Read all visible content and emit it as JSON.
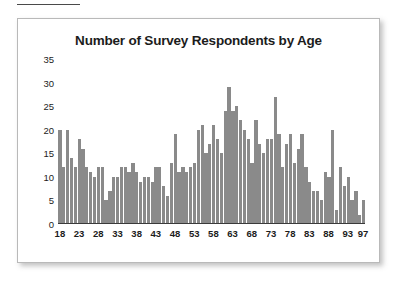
{
  "page": {
    "background_color": "#ffffff",
    "card_background": "#ffffff",
    "card_border_color": "#b9b9b9",
    "bar_color": "#8a8a8a",
    "axis_color": "#3a3a3a",
    "text_color": "#1c1c1c"
  },
  "chart_data": {
    "type": "bar",
    "title": "Number of Survey Respondents by Age",
    "xlabel": "",
    "ylabel": "",
    "ylim": [
      0,
      35
    ],
    "yticks": [
      0,
      5,
      10,
      15,
      20,
      25,
      30,
      35
    ],
    "xticks": [
      18,
      23,
      28,
      33,
      38,
      43,
      48,
      53,
      58,
      63,
      68,
      73,
      78,
      83,
      88,
      93,
      97
    ],
    "xtick_labels": [
      "18",
      "23",
      "28",
      "33",
      "38",
      "43",
      "48",
      "53",
      "58",
      "63",
      "68",
      "73",
      "78",
      "83",
      "88",
      "93",
      "97"
    ],
    "grid": false,
    "legend": false,
    "legend_position": "none",
    "xlim": [
      18,
      97
    ],
    "categories": [
      18,
      19,
      20,
      21,
      22,
      23,
      24,
      25,
      26,
      27,
      28,
      29,
      30,
      31,
      32,
      33,
      34,
      35,
      36,
      37,
      38,
      39,
      40,
      41,
      42,
      43,
      44,
      45,
      46,
      47,
      48,
      49,
      50,
      51,
      52,
      53,
      54,
      55,
      56,
      57,
      58,
      59,
      60,
      61,
      62,
      63,
      64,
      65,
      66,
      67,
      68,
      69,
      70,
      71,
      72,
      73,
      74,
      75,
      76,
      77,
      78,
      79,
      80,
      81,
      82,
      83,
      84,
      85,
      86,
      87,
      88,
      89,
      90,
      91,
      92,
      93,
      94,
      95,
      96,
      97
    ],
    "values": [
      20,
      12,
      20,
      14,
      12,
      18,
      16,
      12,
      11,
      10,
      12,
      12,
      5,
      7,
      10,
      10,
      12,
      12,
      11,
      13,
      11,
      9,
      10,
      10,
      9,
      12,
      12,
      8,
      6,
      13,
      19,
      11,
      12,
      11,
      12,
      13,
      20,
      21,
      15,
      17,
      21,
      18,
      15,
      24,
      29,
      24,
      25,
      22,
      20,
      18,
      13,
      22,
      17,
      15,
      18,
      18,
      27,
      19,
      12,
      17,
      19,
      13,
      16,
      19,
      12,
      9,
      7,
      7,
      5,
      11,
      10,
      20,
      3,
      12,
      8,
      10,
      5,
      7,
      2,
      5
    ],
    "tail_values_note": "",
    "series_name": "Respondents"
  },
  "extra_tail": {
    "categories": [
      93,
      94,
      95,
      96,
      97
    ],
    "values": [
      3,
      1,
      1,
      1,
      1
    ]
  }
}
